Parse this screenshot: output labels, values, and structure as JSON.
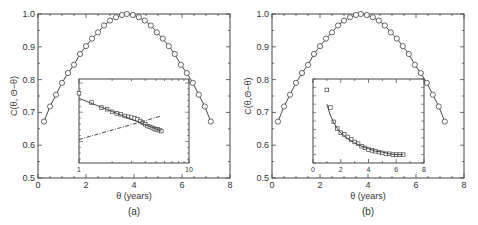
{
  "chart_data": [
    {
      "panel": "(a)",
      "type": "line",
      "title": "",
      "xlabel": "θ (years)",
      "ylabel": "C(θ, Θ−θ)",
      "xlim": [
        0,
        8
      ],
      "ylim": [
        0.5,
        1.0
      ],
      "xticks": [
        0,
        2,
        4,
        6,
        8
      ],
      "yticks": [
        0.5,
        0.6,
        0.7,
        0.8,
        0.9,
        1.0
      ],
      "ytick_labels": [
        "0.5",
        "0.6",
        "0.7",
        "0.8",
        "0.9",
        "1.0"
      ],
      "grid": false,
      "series": [
        {
          "name": "data (circles) with fit line",
          "marker": "circle",
          "x": [
            0.25,
            0.5,
            0.75,
            1.0,
            1.25,
            1.5,
            1.75,
            2.0,
            2.25,
            2.5,
            2.75,
            3.0,
            3.25,
            3.5,
            3.7,
            3.95,
            4.2,
            4.45,
            4.7,
            4.95,
            5.2,
            5.45,
            5.7,
            5.95,
            6.2,
            6.45,
            6.7,
            6.95,
            7.2
          ],
          "y": [
            0.672,
            0.718,
            0.754,
            0.79,
            0.82,
            0.845,
            0.878,
            0.902,
            0.925,
            0.944,
            0.965,
            0.98,
            0.99,
            0.997,
            1.0,
            0.997,
            0.99,
            0.98,
            0.965,
            0.944,
            0.925,
            0.902,
            0.878,
            0.845,
            0.82,
            0.79,
            0.754,
            0.718,
            0.672
          ]
        }
      ],
      "inset": {
        "type": "line",
        "xscale": "log",
        "yscale": "log",
        "xlim": [
          1,
          10
        ],
        "xtick_labels": [
          "1",
          "10"
        ],
        "ytick_labels": [],
        "series": [
          {
            "name": "data (squares)",
            "marker": "square",
            "x": [
              1.0,
              1.3,
              1.6,
              1.8,
              2.0,
              2.2,
              2.4,
              2.6,
              2.8,
              3.0,
              3.2,
              3.4,
              3.6,
              3.8,
              4.0,
              4.2,
              4.4,
              4.6,
              4.8,
              5.0,
              5.2,
              5.4,
              5.6
            ],
            "y_rel": [
              0.83,
              0.72,
              0.66,
              0.64,
              0.61,
              0.59,
              0.58,
              0.56,
              0.55,
              0.54,
              0.53,
              0.52,
              0.5,
              0.48,
              0.46,
              0.44,
              0.43,
              0.42,
              0.41,
              0.4,
              0.4,
              0.39,
              0.38
            ]
          },
          {
            "name": "power-law fit (solid)",
            "style": "solid",
            "x": [
              1,
              5.6
            ],
            "y_rel": [
              0.77,
              0.38
            ]
          },
          {
            "name": "rising trend (dash-dot)",
            "style": "dashdot",
            "x": [
              1,
              5.6
            ],
            "y_rel": [
              0.28,
              0.56
            ]
          }
        ]
      }
    },
    {
      "panel": "(b)",
      "type": "line",
      "title": "",
      "xlabel": "θ (years)",
      "ylabel": "C(θ,Θ−θ)",
      "xlim": [
        0,
        8
      ],
      "ylim": [
        0.5,
        1.0
      ],
      "xticks": [
        0,
        2,
        4,
        6,
        8
      ],
      "yticks": [
        0.5,
        0.6,
        0.7,
        0.8,
        0.9,
        1.0
      ],
      "ytick_labels": [
        "0.5",
        "0.6",
        "0.7",
        "0.8",
        "0.9",
        "1.0"
      ],
      "grid": false,
      "series": [
        {
          "name": "data (circles) with fit line",
          "marker": "circle",
          "x": [
            0.25,
            0.5,
            0.75,
            1.0,
            1.25,
            1.5,
            1.75,
            2.0,
            2.25,
            2.5,
            2.75,
            3.0,
            3.25,
            3.5,
            3.7,
            3.95,
            4.2,
            4.45,
            4.7,
            4.95,
            5.2,
            5.45,
            5.7,
            5.95,
            6.2,
            6.45,
            6.7,
            6.95,
            7.2
          ],
          "y": [
            0.672,
            0.718,
            0.754,
            0.79,
            0.82,
            0.845,
            0.878,
            0.902,
            0.925,
            0.944,
            0.965,
            0.98,
            0.99,
            0.997,
            1.0,
            0.997,
            0.99,
            0.98,
            0.965,
            0.944,
            0.925,
            0.902,
            0.878,
            0.845,
            0.82,
            0.79,
            0.754,
            0.718,
            0.672
          ]
        }
      ],
      "inset": {
        "type": "line",
        "xscale": "linear",
        "xlim": [
          0,
          8
        ],
        "xtick_labels": [
          "0",
          "2",
          "4",
          "6",
          "8"
        ],
        "ytick_labels": [],
        "series": [
          {
            "name": "data (squares)",
            "marker": "square",
            "x": [
              1.0,
              1.25,
              1.5,
              1.75,
              2.0,
              2.25,
              2.5,
              2.75,
              3.0,
              3.25,
              3.5,
              3.75,
              4.0,
              4.25,
              4.5,
              4.75,
              5.0,
              5.25,
              5.5,
              5.75,
              6.0,
              6.25,
              6.5
            ],
            "y_rel": [
              0.87,
              0.66,
              0.49,
              0.41,
              0.36,
              0.34,
              0.31,
              0.28,
              0.25,
              0.23,
              0.2,
              0.18,
              0.16,
              0.15,
              0.14,
              0.13,
              0.12,
              0.11,
              0.11,
              0.1,
              0.1,
              0.1,
              0.1
            ]
          },
          {
            "name": "decay fit (solid)",
            "style": "solid",
            "x": [
              1.0,
              1.25,
              1.5,
              1.75,
              2.0,
              2.5,
              3.0,
              3.5,
              4.0,
              4.5,
              5.0,
              5.5,
              6.0,
              6.5
            ],
            "y_rel": [
              0.7,
              0.57,
              0.48,
              0.41,
              0.36,
              0.29,
              0.24,
              0.2,
              0.17,
              0.14,
              0.13,
              0.11,
              0.1,
              0.1
            ]
          }
        ]
      }
    }
  ],
  "panels": [
    {
      "caption": "(a)",
      "xlabel": "θ (years)",
      "ylabel": "C(θ, Θ−θ)",
      "inset_xticks": [
        "1",
        "10"
      ]
    },
    {
      "caption": "(b)",
      "xlabel": "θ (years)",
      "ylabel": "C(θ,Θ−θ)",
      "inset_xticks": [
        "0",
        "2",
        "4",
        "6",
        "8"
      ]
    }
  ],
  "main_xtick_labels": [
    "0",
    "2",
    "4",
    "6",
    "8"
  ],
  "main_ytick_labels": [
    "0.5",
    "0.6",
    "0.7",
    "0.8",
    "0.9",
    "1.0"
  ],
  "colors": {
    "line": "#333333",
    "marker": "#444444",
    "frame": "#444444",
    "background": "#ffffff"
  }
}
